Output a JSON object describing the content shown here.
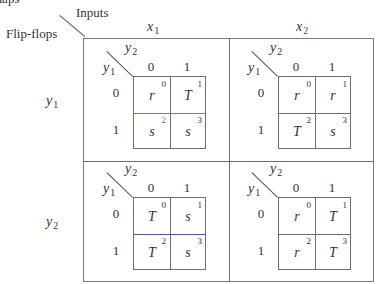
{
  "title_fragment": "maps",
  "corner": {
    "inputs_label": "Inputs",
    "flipflops_label": "Flip-flops"
  },
  "columns": [
    {
      "var": "x",
      "sub": "1"
    },
    {
      "var": "x",
      "sub": "2"
    }
  ],
  "rows": [
    {
      "var": "y",
      "sub": "1"
    },
    {
      "var": "y",
      "sub": "2"
    }
  ],
  "kmap_axes": {
    "col_var": {
      "var": "y",
      "sub": "2"
    },
    "row_var": {
      "var": "y",
      "sub": "1"
    },
    "col_values": [
      "0",
      "1"
    ],
    "row_values": [
      "0",
      "1"
    ]
  },
  "kmaps": [
    {
      "row": "y1",
      "col": "x1",
      "cells": [
        {
          "value": "r",
          "index": "0"
        },
        {
          "value": "T",
          "index": "1"
        },
        {
          "value": "s",
          "index": "2"
        },
        {
          "value": "s",
          "index": "3"
        }
      ]
    },
    {
      "row": "y1",
      "col": "x2",
      "cells": [
        {
          "value": "r",
          "index": "0"
        },
        {
          "value": "r",
          "index": "1"
        },
        {
          "value": "T",
          "index": "2"
        },
        {
          "value": "s",
          "index": "3"
        }
      ]
    },
    {
      "row": "y2",
      "col": "x1",
      "cells": [
        {
          "value": "T",
          "index": "0"
        },
        {
          "value": "s",
          "index": "1"
        },
        {
          "value": "T",
          "index": "2"
        },
        {
          "value": "s",
          "index": "3"
        }
      ]
    },
    {
      "row": "y2",
      "col": "x2",
      "cells": [
        {
          "value": "r",
          "index": "0"
        },
        {
          "value": "T",
          "index": "1"
        },
        {
          "value": "r",
          "index": "2"
        },
        {
          "value": "T",
          "index": "3"
        }
      ]
    }
  ],
  "colors": {
    "line": "#6e6e6e",
    "text": "#333333",
    "accent_red": "#d04040"
  }
}
